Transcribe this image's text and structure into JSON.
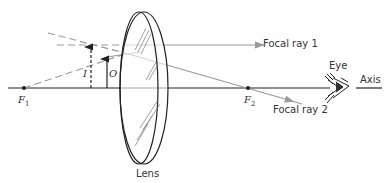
{
  "diagram": {
    "type": "optics-ray-diagram",
    "labels": {
      "focal_ray_1": "Focal ray 1",
      "focal_ray_2": "Focal ray 2",
      "f1": "F",
      "f1_sub": "1",
      "f2": "F",
      "f2_sub": "2",
      "image": "I",
      "object": "O",
      "lens": "Lens",
      "eye": "Eye",
      "axis": "Axis"
    },
    "colors": {
      "axis": "#222222",
      "rays": "#888888",
      "lens": "#222222"
    }
  }
}
